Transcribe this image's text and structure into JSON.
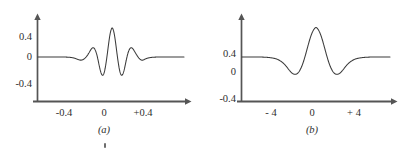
{
  "figure": {
    "caption_a": "(a)",
    "caption_b": "(b)",
    "stroke_color": "#3a3a3a",
    "axis_color": "#555555",
    "background": "#ffffff"
  },
  "panel_a": {
    "caption": "(a)",
    "y_ticks": [
      "0.4",
      "0",
      "-0.4"
    ],
    "x_ticks": [
      "-0.4",
      "0",
      "+0.4"
    ]
  },
  "panel_b": {
    "caption": "(b)",
    "y_ticks": [
      "0.4",
      "0",
      "-0.4"
    ],
    "x_ticks": [
      "- 4",
      "0",
      "+ 4"
    ]
  },
  "chart_data": [
    {
      "type": "line",
      "title": "(a)",
      "xlabel": "",
      "ylabel": "",
      "xlim": [
        -0.62,
        0.62
      ],
      "ylim": [
        -0.52,
        0.66
      ],
      "x_tick_values": [
        -0.4,
        0,
        0.4
      ],
      "x_tick_labels": [
        "-0.4",
        "0",
        "+0.4"
      ],
      "y_tick_values": [
        0.4,
        0,
        -0.4
      ],
      "y_tick_labels": [
        "0.4",
        "0",
        "-0.4"
      ],
      "grid": false,
      "legend": "none",
      "description": "Gabor wavelet: Gaussian-modulated cosine oscillation centred at 0, decaying to zero outside about +/-0.3",
      "series": [
        {
          "name": "gabor-wavelet",
          "x": [
            -0.62,
            -0.58,
            -0.54,
            -0.5,
            -0.46,
            -0.42,
            -0.38,
            -0.35,
            -0.33,
            -0.31,
            -0.29,
            -0.275,
            -0.26,
            -0.245,
            -0.23,
            -0.215,
            -0.2,
            -0.19,
            -0.18,
            -0.17,
            -0.16,
            -0.15,
            -0.14,
            -0.13,
            -0.12,
            -0.11,
            -0.1,
            -0.09,
            -0.08,
            -0.07,
            -0.06,
            -0.05,
            -0.04,
            -0.03,
            -0.02,
            -0.01,
            0.0,
            0.01,
            0.02,
            0.03,
            0.04,
            0.05,
            0.06,
            0.07,
            0.08,
            0.09,
            0.1,
            0.11,
            0.12,
            0.13,
            0.14,
            0.15,
            0.16,
            0.17,
            0.18,
            0.19,
            0.2,
            0.215,
            0.23,
            0.245,
            0.26,
            0.275,
            0.29,
            0.31,
            0.33,
            0.35,
            0.38,
            0.42,
            0.46,
            0.5,
            0.54,
            0.58,
            0.62
          ],
          "y": [
            0.0,
            0.0,
            0.0,
            0.0,
            0.0,
            0.0,
            -0.002,
            -0.006,
            -0.012,
            -0.022,
            -0.038,
            -0.05,
            -0.058,
            -0.055,
            -0.038,
            -0.008,
            0.032,
            0.068,
            0.105,
            0.14,
            0.165,
            0.172,
            0.155,
            0.11,
            0.04,
            -0.055,
            -0.16,
            -0.255,
            -0.32,
            -0.34,
            -0.305,
            -0.215,
            -0.08,
            0.08,
            0.25,
            0.4,
            0.5,
            0.54,
            0.5,
            0.4,
            0.25,
            0.08,
            -0.08,
            -0.215,
            -0.305,
            -0.34,
            -0.32,
            -0.255,
            -0.16,
            -0.055,
            0.04,
            0.11,
            0.155,
            0.172,
            0.165,
            0.14,
            0.105,
            0.05,
            0.0,
            -0.038,
            -0.058,
            -0.055,
            -0.038,
            -0.022,
            -0.012,
            -0.006,
            -0.002,
            0.0,
            0.0,
            0.0,
            0.0,
            0.0,
            0.0
          ]
        }
      ]
    },
    {
      "type": "line",
      "title": "(b)",
      "xlabel": "",
      "ylabel": "",
      "xlim": [
        -7.2,
        7.2
      ],
      "ylim": [
        -0.52,
        0.66
      ],
      "x_tick_values": [
        -4,
        0,
        4
      ],
      "x_tick_labels": [
        "- 4",
        "0",
        "+ 4"
      ],
      "y_tick_values": [
        0.4,
        0,
        -0.4
      ],
      "y_tick_labels": [
        "0.4",
        "0",
        "-0.4"
      ],
      "grid": false,
      "legend": "none",
      "description": "Envelope / transform: broad positive central lobe peaking near 0.55 at x=0, flanked by two negative lobes reaching about -0.32 near x=+/-2, then flat at zero",
      "series": [
        {
          "name": "envelope",
          "x": [
            -7.2,
            -6.8,
            -6.4,
            -6.0,
            -5.6,
            -5.2,
            -4.8,
            -4.4,
            -4.0,
            -3.7,
            -3.4,
            -3.2,
            -3.0,
            -2.8,
            -2.6,
            -2.4,
            -2.2,
            -2.0,
            -1.8,
            -1.6,
            -1.4,
            -1.2,
            -1.0,
            -0.8,
            -0.6,
            -0.4,
            -0.2,
            0.0,
            0.2,
            0.4,
            0.6,
            0.8,
            1.0,
            1.2,
            1.4,
            1.6,
            1.8,
            2.0,
            2.2,
            2.4,
            2.6,
            2.8,
            3.0,
            3.2,
            3.4,
            3.7,
            4.0,
            4.4,
            4.8,
            5.2,
            5.6,
            6.0,
            6.4,
            6.8,
            7.2
          ],
          "y": [
            0.0,
            0.0,
            0.0,
            0.0,
            0.0,
            -0.002,
            -0.006,
            -0.014,
            -0.028,
            -0.048,
            -0.082,
            -0.112,
            -0.15,
            -0.196,
            -0.245,
            -0.288,
            -0.315,
            -0.322,
            -0.305,
            -0.258,
            -0.18,
            -0.075,
            0.055,
            0.195,
            0.33,
            0.44,
            0.515,
            0.548,
            0.515,
            0.44,
            0.33,
            0.195,
            0.055,
            -0.075,
            -0.18,
            -0.258,
            -0.305,
            -0.322,
            -0.315,
            -0.288,
            -0.245,
            -0.196,
            -0.15,
            -0.112,
            -0.082,
            -0.048,
            -0.028,
            -0.014,
            -0.006,
            -0.002,
            0.0,
            0.0,
            0.0,
            0.0,
            0.0
          ]
        }
      ]
    }
  ]
}
